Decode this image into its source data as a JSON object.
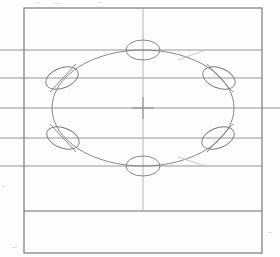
{
  "document": {
    "title": "Bolt Circle Hole Pattern Drawing",
    "kind": "engineering-drawing",
    "medium": "scanned-line-drawing",
    "canvas": {
      "width": 280,
      "height": 257
    }
  },
  "colors": {
    "paper": "#fdfdfc",
    "border_line": "#6e6e70",
    "object_line": "#7b7b7d",
    "center_line": "#a3a3a5",
    "projection_line": "#8a8a8c",
    "faint_line": "#bdbcba"
  },
  "strokes": {
    "border_width": 1.1,
    "object_width": 0.9,
    "center_width": 0.8,
    "projection_width": 0.9,
    "faint_width": 0.8
  },
  "geometry": {
    "outer_rectangle": {
      "x": 24,
      "y": 8,
      "width": 238,
      "height": 245
    },
    "inner_divider_line": {
      "x1": 24,
      "y1": 211,
      "x2": 262,
      "y2": 211
    },
    "vertical_centerline": {
      "x": 143,
      "y1": 8,
      "y2": 211
    },
    "horizontal_centerline": {
      "y": 108,
      "x1": 0,
      "x2": 280
    },
    "center_mark": {
      "cx": 143,
      "cy": 108,
      "arm": 11
    },
    "bolt_circle": {
      "cx": 143,
      "cy": 108,
      "rx": 91,
      "ry": 58
    },
    "projection_lines": [
      {
        "name": "projection-line-1",
        "y": 50,
        "x1": 0,
        "x2": 262
      },
      {
        "name": "projection-line-2",
        "y": 78,
        "x1": 0,
        "x2": 262
      },
      {
        "name": "projection-line-3",
        "y": 108,
        "x1": 0,
        "x2": 280
      },
      {
        "name": "projection-line-4",
        "y": 138,
        "x1": 0,
        "x2": 262
      },
      {
        "name": "projection-line-5",
        "y": 166,
        "x1": 0,
        "x2": 262
      }
    ],
    "holes": [
      {
        "id": "hole-top",
        "label": "1",
        "cx": 143,
        "cy": 50,
        "rx": 17,
        "ry": 10,
        "rotation": 0,
        "hatch": false,
        "angle_deg": 90
      },
      {
        "id": "hole-upper-left",
        "label": "2",
        "cx": 62,
        "cy": 78,
        "rx": 17,
        "ry": 10,
        "rotation": -22,
        "hatch": true,
        "angle_deg": 150
      },
      {
        "id": "hole-upper-right",
        "label": "3",
        "cx": 219,
        "cy": 78,
        "rx": 17,
        "ry": 10,
        "rotation": 22,
        "hatch": true,
        "angle_deg": 30
      },
      {
        "id": "hole-lower-left",
        "label": "4",
        "cx": 63,
        "cy": 138,
        "rx": 17,
        "ry": 10,
        "rotation": 22,
        "hatch": true,
        "angle_deg": 210
      },
      {
        "id": "hole-lower-right",
        "label": "5",
        "cx": 218,
        "cy": 138,
        "rx": 17,
        "ry": 10,
        "rotation": -22,
        "hatch": true,
        "angle_deg": 330
      },
      {
        "id": "hole-bottom",
        "label": "6",
        "cx": 143,
        "cy": 166,
        "rx": 17,
        "ry": 10,
        "rotation": 0,
        "hatch": false,
        "angle_deg": 270
      }
    ],
    "hole_tick_marks": [
      {
        "id": "tick-upper-left",
        "x1": 50,
        "y1": 92,
        "x2": 76,
        "y2": 64
      },
      {
        "id": "tick-upper-right",
        "x1": 207,
        "y1": 64,
        "x2": 233,
        "y2": 92
      },
      {
        "id": "tick-lower-left",
        "x1": 50,
        "y1": 124,
        "x2": 76,
        "y2": 152
      },
      {
        "id": "tick-lower-right",
        "x1": 207,
        "y1": 152,
        "x2": 233,
        "y2": 124
      }
    ],
    "faint_arc_segments": [
      {
        "id": "faint-arc-top-right",
        "x1": 178,
        "y1": 60,
        "x2": 205,
        "y2": 50
      },
      {
        "id": "faint-arc-bottom-right",
        "x1": 178,
        "y1": 157,
        "x2": 205,
        "y2": 166
      }
    ],
    "scan_specks": [
      {
        "x": 36,
        "y": 2,
        "w": 3,
        "h": 1
      },
      {
        "x": 54,
        "y": 3,
        "w": 7,
        "h": 1
      },
      {
        "x": 98,
        "y": 2,
        "w": 4,
        "h": 1
      },
      {
        "x": 2,
        "y": 186,
        "w": 3,
        "h": 1
      },
      {
        "x": 268,
        "y": 232,
        "w": 4,
        "h": 1
      },
      {
        "x": 12,
        "y": 247,
        "w": 5,
        "h": 1
      }
    ]
  }
}
